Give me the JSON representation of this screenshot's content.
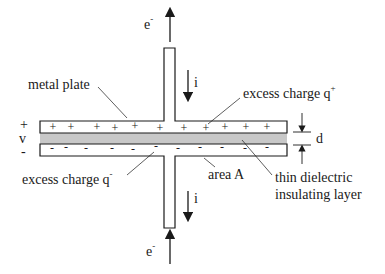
{
  "diagram": {
    "labels": {
      "electron_top": "e",
      "electron_top_sup": "-",
      "current_top": "i",
      "metal_plate": "metal plate",
      "excess_pos": "excess charge q",
      "excess_pos_sup": "+",
      "voltage_plus": "+",
      "voltage_v": "v",
      "voltage_minus": "-",
      "separation": "d",
      "excess_neg": "excess charge q",
      "excess_neg_sup": "-",
      "area": "area A",
      "dielectric_line1": "thin dielectric",
      "dielectric_line2": "insulating layer",
      "current_bottom": "i",
      "electron_bottom": "e",
      "electron_bottom_sup": "-"
    },
    "top_plate_signs": [
      "+",
      "+",
      "+",
      "+",
      "+",
      "+",
      "+",
      "+",
      "+",
      "+",
      "+"
    ],
    "bottom_plate_signs": [
      "-",
      "-",
      "-",
      "-",
      "-",
      "-",
      "-",
      "-",
      "-",
      "-",
      "-"
    ],
    "colors": {
      "line": "#1a1a1a",
      "dielectric": "#c8c8c8",
      "plate_fill": "#ffffff"
    }
  }
}
